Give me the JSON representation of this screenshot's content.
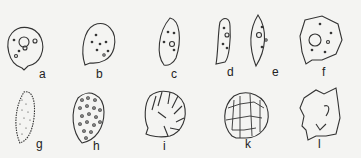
{
  "figure": {
    "panels": [
      {
        "id": "a",
        "label": "a",
        "description": "round cell with nucleus and small granules"
      },
      {
        "id": "b",
        "label": "b",
        "description": "ovoid cell with scattered granules"
      },
      {
        "id": "c",
        "label": "c",
        "description": "elongate ovoid cell with nucleus"
      },
      {
        "id": "d",
        "label": "d",
        "description": "narrow elongate cell"
      },
      {
        "id": "e",
        "label": "e",
        "description": "spindle-shaped cell"
      },
      {
        "id": "f",
        "label": "f",
        "description": "polygonal cell with large nucleus"
      },
      {
        "id": "g",
        "label": "g",
        "description": "elongate spore with fine punctate surface"
      },
      {
        "id": "h",
        "label": "h",
        "description": "ovoid spore with verrucate surface"
      },
      {
        "id": "i",
        "label": "i",
        "description": "rounded spore with ribbed ornamentation"
      },
      {
        "id": "k",
        "label": "k",
        "description": "round spore with reticulate surface"
      },
      {
        "id": "l",
        "label": "l",
        "description": "irregular angular spore"
      }
    ],
    "colors": {
      "line": "#333333",
      "background": "#f4f4f2"
    }
  }
}
